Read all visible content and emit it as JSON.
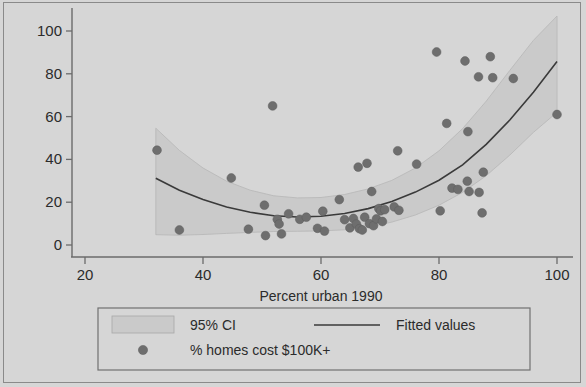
{
  "chart_data": {
    "type": "scatter",
    "title": "",
    "xlabel": "Percent urban 1990",
    "ylabel": "",
    "xlim": [
      20,
      100
    ],
    "ylim": [
      0,
      107
    ],
    "xticks": [
      20,
      40,
      60,
      80,
      100
    ],
    "yticks": [
      0,
      20,
      40,
      60,
      80,
      100
    ],
    "grid": false,
    "background_color": "#d6d6d6",
    "plot_background_color": "#d6d6d6",
    "marker_color": "#6e6e6e",
    "line_color": "#3a3a3a",
    "ci_fill_color": "#cacaca",
    "axis_color": "#6b6b6b",
    "series": [
      {
        "name": "% homes cost $100K+",
        "type": "scatter",
        "points": [
          [
            32.2,
            44.3
          ],
          [
            36.0,
            7.0
          ],
          [
            44.8,
            31.3
          ],
          [
            50.4,
            18.6
          ],
          [
            50.6,
            4.4
          ],
          [
            47.7,
            7.4
          ],
          [
            51.8,
            65.0
          ],
          [
            52.6,
            12.0
          ],
          [
            52.9,
            9.8
          ],
          [
            53.3,
            5.2
          ],
          [
            54.5,
            14.6
          ],
          [
            56.4,
            12.0
          ],
          [
            57.5,
            13.0
          ],
          [
            59.4,
            7.8
          ],
          [
            60.3,
            15.8
          ],
          [
            60.6,
            6.5
          ],
          [
            63.1,
            21.2
          ],
          [
            64.0,
            11.8
          ],
          [
            64.9,
            8.0
          ],
          [
            65.5,
            12.4
          ],
          [
            66.0,
            9.8
          ],
          [
            66.3,
            36.4
          ],
          [
            66.5,
            7.6
          ],
          [
            67.0,
            7.0
          ],
          [
            67.4,
            13.0
          ],
          [
            67.8,
            38.2
          ],
          [
            68.2,
            10.0
          ],
          [
            68.6,
            25.0
          ],
          [
            68.9,
            9.0
          ],
          [
            69.4,
            12.2
          ],
          [
            69.8,
            17.0
          ],
          [
            70.1,
            16.0
          ],
          [
            70.4,
            11.0
          ],
          [
            70.8,
            16.5
          ],
          [
            72.4,
            17.8
          ],
          [
            73.0,
            44.0
          ],
          [
            73.2,
            16.2
          ],
          [
            76.2,
            37.8
          ],
          [
            79.6,
            90.2
          ],
          [
            80.2,
            16.0
          ],
          [
            81.3,
            56.8
          ],
          [
            82.2,
            26.6
          ],
          [
            83.2,
            26.0
          ],
          [
            84.4,
            86.0
          ],
          [
            84.8,
            29.8
          ],
          [
            84.9,
            53.0
          ],
          [
            85.1,
            25.0
          ],
          [
            86.7,
            78.6
          ],
          [
            86.8,
            24.6
          ],
          [
            87.3,
            15.0
          ],
          [
            87.5,
            34.0
          ],
          [
            88.7,
            88.0
          ],
          [
            89.1,
            78.2
          ],
          [
            92.6,
            77.8
          ],
          [
            100.0,
            61.0
          ]
        ]
      },
      {
        "name": "Fitted values",
        "type": "line",
        "points": [
          [
            32.0,
            31.2
          ],
          [
            36.0,
            25.6
          ],
          [
            40.0,
            21.2
          ],
          [
            44.0,
            17.7
          ],
          [
            48.0,
            15.3
          ],
          [
            52.0,
            13.7
          ],
          [
            56.0,
            13.1
          ],
          [
            60.0,
            13.4
          ],
          [
            64.0,
            14.7
          ],
          [
            68.0,
            17.0
          ],
          [
            72.0,
            20.3
          ],
          [
            76.0,
            24.7
          ],
          [
            80.0,
            30.3
          ],
          [
            84.0,
            37.5
          ],
          [
            88.0,
            47.0
          ],
          [
            92.0,
            58.4
          ],
          [
            96.0,
            71.4
          ],
          [
            100.0,
            85.7
          ]
        ]
      },
      {
        "name": "95% CI",
        "type": "band",
        "upper": [
          [
            32.0,
            54.6
          ],
          [
            36.0,
            44.2
          ],
          [
            40.0,
            36.0
          ],
          [
            44.0,
            29.8
          ],
          [
            48.0,
            25.6
          ],
          [
            52.0,
            23.0
          ],
          [
            56.0,
            22.0
          ],
          [
            60.0,
            22.2
          ],
          [
            64.0,
            23.6
          ],
          [
            68.0,
            26.2
          ],
          [
            72.0,
            30.2
          ],
          [
            76.0,
            36.0
          ],
          [
            80.0,
            44.0
          ],
          [
            84.0,
            54.4
          ],
          [
            88.0,
            67.2
          ],
          [
            92.0,
            81.6
          ],
          [
            96.0,
            95.6
          ],
          [
            100.0,
            107.0
          ]
        ],
        "lower": [
          [
            32.0,
            4.8
          ],
          [
            36.0,
            4.6
          ],
          [
            40.0,
            4.9
          ],
          [
            44.0,
            5.4
          ],
          [
            48.0,
            5.9
          ],
          [
            52.0,
            6.3
          ],
          [
            56.0,
            6.4
          ],
          [
            60.0,
            6.6
          ],
          [
            64.0,
            7.1
          ],
          [
            68.0,
            8.4
          ],
          [
            72.0,
            10.7
          ],
          [
            76.0,
            14.0
          ],
          [
            80.0,
            18.6
          ],
          [
            84.0,
            24.6
          ],
          [
            88.0,
            32.4
          ],
          [
            92.0,
            42.0
          ],
          [
            96.0,
            52.6
          ],
          [
            100.0,
            62.0
          ]
        ]
      }
    ]
  },
  "legend": {
    "ci_label": "95% CI",
    "fitted_label": "Fitted values",
    "scatter_label": "% homes cost $100K+"
  },
  "axis": {
    "x_title": "Percent urban 1990",
    "x_tick_labels": [
      "20",
      "40",
      "60",
      "80",
      "100"
    ],
    "y_tick_labels": [
      "0",
      "20",
      "40",
      "60",
      "80",
      "100"
    ]
  }
}
